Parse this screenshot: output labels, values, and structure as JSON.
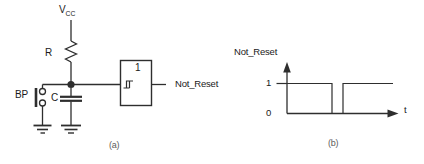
{
  "colors": {
    "line": "#2e2e2e",
    "text": "#1a1a1a",
    "caption": "#5c5c5c"
  },
  "circuit": {
    "vcc": {
      "main": "V",
      "sub": "CC"
    },
    "resistor_label": "R",
    "button_label": "BP",
    "capacitor_label": "C",
    "gate": {
      "label": "1",
      "type": "schmitt-trigger-buffer"
    },
    "output_label": "Not_Reset",
    "caption": "(a)"
  },
  "timing": {
    "title": "Not_Reset",
    "tick_high": "1",
    "tick_low": "0",
    "x_label": "t",
    "caption": "(b)",
    "levels": [
      1,
      0,
      1
    ],
    "waveform_points": [
      [
        287,
        83.5
      ],
      [
        332,
        83.5
      ],
      [
        332,
        113.5
      ],
      [
        343,
        113.5
      ],
      [
        343,
        83.5
      ],
      [
        393,
        83.5
      ]
    ]
  }
}
